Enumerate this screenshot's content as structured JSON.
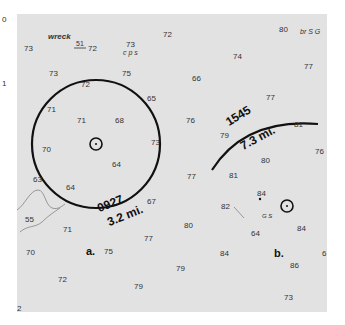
{
  "chart": {
    "background": "#e2e2e2",
    "ink": "#111111",
    "annotations": {
      "wreck_label": "wreck",
      "wreck_depth": "51",
      "bottom_a": "c p s",
      "bottom_b": "br S G",
      "bottom_c": "G S"
    },
    "fix_a": {
      "label": "a.",
      "time": "0927",
      "distance": "3.2 mi."
    },
    "fix_b": {
      "label": "b.",
      "time": "1545",
      "distance": "7.3 mi."
    },
    "soundings": [
      {
        "v": "0",
        "x": 2,
        "y": 16
      },
      {
        "v": "73",
        "x": 24,
        "y": 45
      },
      {
        "v": "72",
        "x": 88,
        "y": 45
      },
      {
        "v": "73",
        "x": 126,
        "y": 41
      },
      {
        "v": "72",
        "x": 163,
        "y": 31
      },
      {
        "v": "80",
        "x": 279,
        "y": 26
      },
      {
        "v": "74",
        "x": 233,
        "y": 53
      },
      {
        "v": "77",
        "x": 304,
        "y": 63
      },
      {
        "v": "73",
        "x": 49,
        "y": 70
      },
      {
        "v": "75",
        "x": 122,
        "y": 70
      },
      {
        "v": "72",
        "x": 81,
        "y": 81
      },
      {
        "v": "1",
        "x": 2,
        "y": 80
      },
      {
        "v": "66",
        "x": 192,
        "y": 75
      },
      {
        "v": "77",
        "x": 266,
        "y": 94
      },
      {
        "v": "65",
        "x": 147,
        "y": 95
      },
      {
        "v": "71",
        "x": 47,
        "y": 106
      },
      {
        "v": "71",
        "x": 77,
        "y": 117
      },
      {
        "v": "68",
        "x": 115,
        "y": 117
      },
      {
        "v": "76",
        "x": 186,
        "y": 117
      },
      {
        "v": "79",
        "x": 220,
        "y": 132
      },
      {
        "v": "81",
        "x": 294,
        "y": 121
      },
      {
        "v": "70",
        "x": 42,
        "y": 146
      },
      {
        "v": "73",
        "x": 151,
        "y": 139
      },
      {
        "v": "76",
        "x": 315,
        "y": 148
      },
      {
        "v": "64",
        "x": 112,
        "y": 161
      },
      {
        "v": "80",
        "x": 261,
        "y": 157
      },
      {
        "v": "77",
        "x": 187,
        "y": 173
      },
      {
        "v": "81",
        "x": 229,
        "y": 172
      },
      {
        "v": "63",
        "x": 33,
        "y": 176
      },
      {
        "v": "64",
        "x": 66,
        "y": 184
      },
      {
        "v": "84",
        "x": 257,
        "y": 190
      },
      {
        "v": "82",
        "x": 221,
        "y": 203
      },
      {
        "v": "67",
        "x": 147,
        "y": 198
      },
      {
        "v": "55",
        "x": 25,
        "y": 216
      },
      {
        "v": "84",
        "x": 297,
        "y": 225
      },
      {
        "v": "71",
        "x": 63,
        "y": 226
      },
      {
        "v": "64",
        "x": 251,
        "y": 230
      },
      {
        "v": "77",
        "x": 144,
        "y": 235
      },
      {
        "v": "80",
        "x": 184,
        "y": 222
      },
      {
        "v": "70",
        "x": 26,
        "y": 249
      },
      {
        "v": "75",
        "x": 104,
        "y": 248
      },
      {
        "v": "84",
        "x": 220,
        "y": 250
      },
      {
        "v": "86",
        "x": 290,
        "y": 262
      },
      {
        "v": "79",
        "x": 176,
        "y": 265
      },
      {
        "v": "72",
        "x": 58,
        "y": 276
      },
      {
        "v": "79",
        "x": 134,
        "y": 283
      },
      {
        "v": "73",
        "x": 284,
        "y": 294
      },
      {
        "v": "2",
        "x": 17,
        "y": 305
      },
      {
        "v": "6",
        "x": 322,
        "y": 250
      }
    ]
  }
}
